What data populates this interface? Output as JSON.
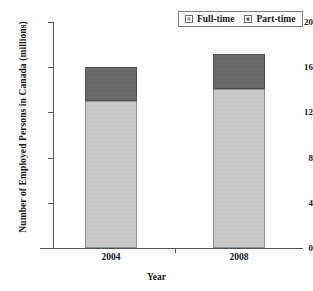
{
  "chart_data": {
    "type": "bar",
    "stacked": true,
    "title": "",
    "xlabel": "Year",
    "ylabel": "Number of Employed Persons in Canada (millions)",
    "categories": [
      "2004",
      "2008"
    ],
    "series": [
      {
        "name": "Full-time",
        "values": [
          13.0,
          14.1
        ],
        "color": "#c9c9c9"
      },
      {
        "name": "Part-time",
        "values": [
          3.0,
          3.1
        ],
        "color": "#6a6a6a"
      }
    ],
    "totals": [
      16.0,
      17.2
    ],
    "ylim": [
      0,
      20
    ],
    "yticks": [
      0,
      4,
      8,
      12,
      16,
      20
    ],
    "ytick_labels": [
      "0",
      "4",
      "8",
      "12",
      "16",
      "20"
    ],
    "grid": false,
    "legend_position": "top-right"
  },
  "legend": {
    "items": [
      {
        "label": "Full-time",
        "swatch": "full"
      },
      {
        "label": "Part-time",
        "swatch": "part"
      }
    ]
  }
}
